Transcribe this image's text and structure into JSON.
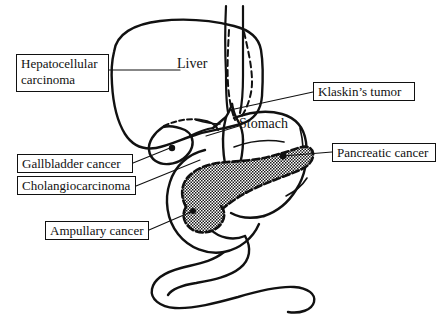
{
  "figure": {
    "background_color": "#ffffff",
    "line_color": "#111111",
    "pancreas_fill": "cross-hatch"
  },
  "organs": [
    {
      "key": "liver",
      "label": "Liver",
      "boxed": false
    },
    {
      "key": "stomach",
      "label": "Stomach",
      "boxed": false
    }
  ],
  "tumor_labels": [
    {
      "key": "hepatocellular",
      "label": "Hepatocellular carcinoma",
      "line1": "Hepatocellular",
      "line2": "carcinoma",
      "boxed": true,
      "side": "left"
    },
    {
      "key": "gallbladder",
      "label": "Gallbladder  cancer",
      "boxed": true,
      "side": "left"
    },
    {
      "key": "cholangio",
      "label": "Cholangiocarcinoma",
      "boxed": true,
      "side": "left"
    },
    {
      "key": "ampullary",
      "label": "Ampullary cancer",
      "boxed": true,
      "side": "left"
    },
    {
      "key": "klatskin",
      "label": "Klaskin’s tumor",
      "boxed": true,
      "side": "right"
    },
    {
      "key": "pancreatic",
      "label": "Pancreatic cancer",
      "boxed": true,
      "side": "right"
    }
  ],
  "icons": {
    "leader_line": "leader-line",
    "pancreas": "pancreas-shape",
    "liver": "liver-shape",
    "stomach": "stomach-shape",
    "gallbladder": "gallbladder-shape",
    "bile_duct": "bile-duct",
    "intestine": "small-intestine-shape"
  }
}
